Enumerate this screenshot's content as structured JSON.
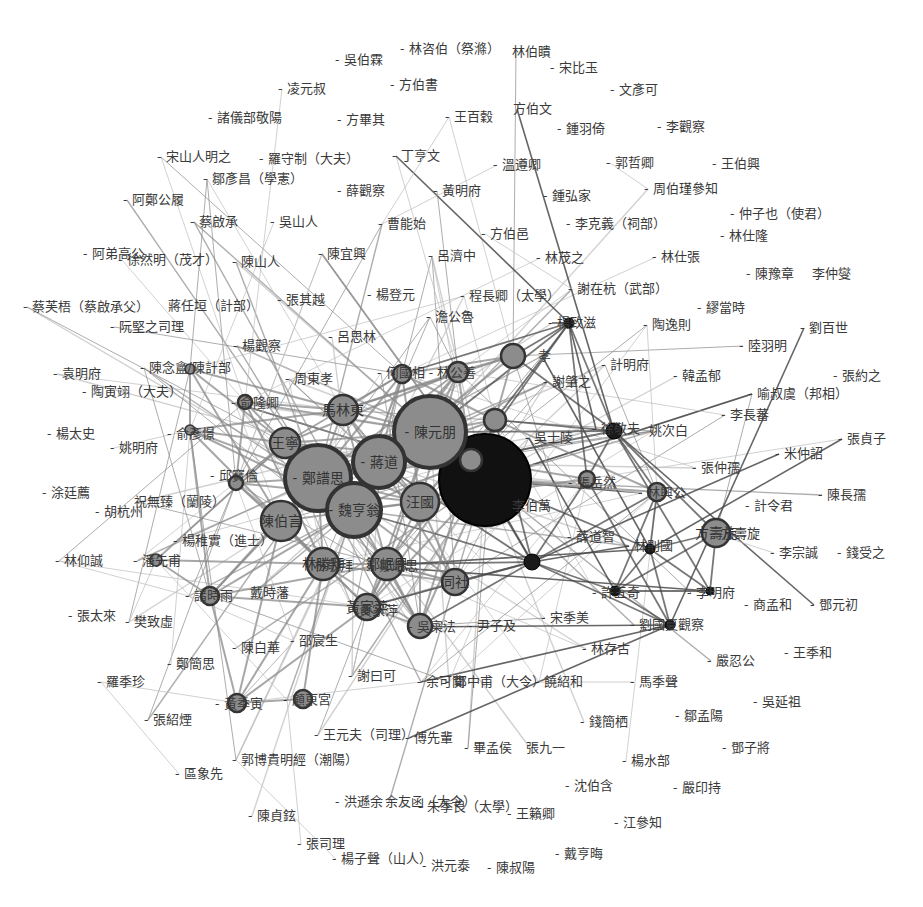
{
  "diagram": {
    "type": "network",
    "title": "",
    "colors": {
      "background": "#ffffff",
      "edge_light": "#bdbdbd",
      "edge_mid": "#8a8a8a",
      "edge_dark": "#4a4a4a",
      "node_fill": "#8c8c8c",
      "node_stroke": "#333333",
      "hub_fill": "#111111",
      "label": "#3a3a3a"
    },
    "nodes": [
      {
        "id": "hub",
        "label": "",
        "x": 485,
        "y": 480,
        "r": 46,
        "kind": "black"
      },
      {
        "id": "n_chen_yuanpeng",
        "label": "陳元朋",
        "x": 430,
        "y": 432,
        "r": 36,
        "kind": "big"
      },
      {
        "id": "n_zheng",
        "label": "鄭譜思",
        "x": 318,
        "y": 478,
        "r": 33,
        "kind": "big"
      },
      {
        "id": "n_jiang",
        "label": "蔣道",
        "x": 379,
        "y": 462,
        "r": 26,
        "kind": "big"
      },
      {
        "id": "n_wei",
        "label": "魏亨翁",
        "x": 354,
        "y": 510,
        "r": 27,
        "kind": "big"
      },
      {
        "id": "n_chen_bo",
        "label": "陳伯言",
        "x": 281,
        "y": 521,
        "r": 20,
        "kind": "mid"
      },
      {
        "id": "n_wang_xuan",
        "label": "汪國",
        "x": 420,
        "y": 502,
        "r": 19,
        "kind": "mid"
      },
      {
        "id": "n_ma",
        "label": "馬林東",
        "x": 343,
        "y": 410,
        "r": 15,
        "kind": "mid"
      },
      {
        "id": "n_wang_yu",
        "label": "王寧",
        "x": 285,
        "y": 443,
        "r": 15,
        "kind": "mid"
      },
      {
        "id": "n_lin_xi",
        "label": "林勝拜",
        "x": 323,
        "y": 564,
        "r": 16,
        "kind": "mid"
      },
      {
        "id": "n_deng",
        "label": "鄒岷思",
        "x": 387,
        "y": 564,
        "r": 16,
        "kind": "mid"
      },
      {
        "id": "n_tong",
        "label": "同社",
        "x": 455,
        "y": 582,
        "r": 13,
        "kind": "mid"
      },
      {
        "id": "n_wu_yu",
        "label": "吳奕玉",
        "x": 471,
        "y": 460,
        "r": 11,
        "kind": "mid"
      },
      {
        "id": "n_zhou_qi",
        "label": "周岐之",
        "x": 495,
        "y": 420,
        "r": 11,
        "kind": "mid"
      },
      {
        "id": "n_hu_xing",
        "label": "胡景孝",
        "x": 513,
        "y": 356,
        "r": 12,
        "kind": "mid"
      },
      {
        "id": "n_hu_xian",
        "label": "何國相",
        "x": 402,
        "y": 374,
        "r": 9,
        "kind": "mid"
      },
      {
        "id": "n_lin_gongshan",
        "label": "林公善",
        "x": 458,
        "y": 372,
        "r": 10,
        "kind": "mid"
      },
      {
        "id": "n_huang_jia",
        "label": "黃家萍",
        "x": 367,
        "y": 607,
        "r": 13,
        "kind": "mid"
      },
      {
        "id": "n_wu_jiwei",
        "label": "吳寀法",
        "x": 420,
        "y": 626,
        "r": 12,
        "kind": "mid"
      },
      {
        "id": "n_zhang_zhaoran",
        "label": "張岳然",
        "x": 587,
        "y": 479,
        "r": 8,
        "kind": "mid"
      },
      {
        "id": "n_lin_gong",
        "label": "林興公",
        "x": 657,
        "y": 492,
        "r": 9,
        "kind": "mid"
      },
      {
        "id": "n_fang_qi",
        "label": "方壽旋",
        "x": 716,
        "y": 533,
        "r": 14,
        "kind": "mid"
      },
      {
        "id": "n_qiu",
        "label": "邱寶",
        "x": 236,
        "y": 483,
        "r": 7,
        "kind": "mid"
      },
      {
        "id": "n_yu_long",
        "label": "俞隆卿",
        "x": 245,
        "y": 402,
        "r": 7,
        "kind": "mid"
      },
      {
        "id": "n_chen_nian",
        "label": "陳念盦",
        "x": 190,
        "y": 369,
        "r": 5,
        "kind": "small"
      },
      {
        "id": "n_yu_xin",
        "label": "俞彥憬",
        "x": 190,
        "y": 430,
        "r": 5,
        "kind": "small"
      },
      {
        "id": "n_zhu_shu",
        "label": "諸時雨",
        "x": 210,
        "y": 596,
        "r": 9,
        "kind": "mid"
      },
      {
        "id": "n_qian",
        "label": "潘先甫",
        "x": 156,
        "y": 560,
        "r": 6,
        "kind": "small"
      },
      {
        "id": "n_huang_ji",
        "label": "黃季寅",
        "x": 237,
        "y": 703,
        "r": 9,
        "kind": "mid"
      },
      {
        "id": "n_gu",
        "label": "顧東宮",
        "x": 303,
        "y": 699,
        "r": 9,
        "kind": "mid"
      },
      {
        "id": "n_yang_zhi",
        "label": "楊致滋",
        "x": 569,
        "y": 323,
        "r": 5,
        "kind": "dark"
      },
      {
        "id": "n_xu_dafu",
        "label": "徐敬夫",
        "x": 614,
        "y": 431,
        "r": 8,
        "kind": "dark"
      },
      {
        "id": "n_black2",
        "label": "林則國",
        "x": 532,
        "y": 562,
        "r": 8,
        "kind": "dark"
      },
      {
        "id": "n_lin_li",
        "label": "林禮國",
        "x": 650,
        "y": 549,
        "r": 5,
        "kind": "dark"
      },
      {
        "id": "n_xu_qi",
        "label": "許五奇",
        "x": 615,
        "y": 591,
        "r": 5,
        "kind": "dark"
      },
      {
        "id": "n_li_mingfu",
        "label": "李明府",
        "x": 710,
        "y": 591,
        "r": 4,
        "kind": "dark"
      },
      {
        "id": "n_liu_guan",
        "label": "劉國夏觀察",
        "x": 670,
        "y": 625,
        "r": 5,
        "kind": "dark"
      }
    ],
    "labels": [
      {
        "text": "- 吳伯霖",
        "x": 335,
        "y": 64
      },
      {
        "text": "- 林咨伯（祭滌）",
        "x": 400,
        "y": 53
      },
      {
        "text": "林伯瞶",
        "x": 512,
        "y": 56
      },
      {
        "text": "- 宋比玉",
        "x": 550,
        "y": 72
      },
      {
        "text": "- 凌元叔",
        "x": 278,
        "y": 93
      },
      {
        "text": "- 方伯書",
        "x": 390,
        "y": 89
      },
      {
        "text": "- 文彥可",
        "x": 610,
        "y": 94
      },
      {
        "text": "- 諸儀部敬陽",
        "x": 208,
        "y": 122
      },
      {
        "text": "- 方畢其",
        "x": 337,
        "y": 124
      },
      {
        "text": "- 王百穀",
        "x": 445,
        "y": 121
      },
      {
        "text": "方伯文",
        "x": 513,
        "y": 113
      },
      {
        "text": "- 鍾羽倚",
        "x": 557,
        "y": 133
      },
      {
        "text": "- 李觀察",
        "x": 657,
        "y": 131
      },
      {
        "text": "- 宋山人明之",
        "x": 157,
        "y": 161
      },
      {
        "text": "- 羅守制（大夫）",
        "x": 259,
        "y": 163
      },
      {
        "text": "- 丁亨文",
        "x": 392,
        "y": 160
      },
      {
        "text": "- 溫遵卿",
        "x": 493,
        "y": 169
      },
      {
        "text": "- 郭哲卿",
        "x": 606,
        "y": 167
      },
      {
        "text": "- 王伯興",
        "x": 712,
        "y": 168
      },
      {
        "text": "- 鄒彥昌（學憲）",
        "x": 203,
        "y": 183
      },
      {
        "text": "- 薛觀察",
        "x": 337,
        "y": 195
      },
      {
        "text": "- 黃明府",
        "x": 433,
        "y": 195
      },
      {
        "text": "- 鍾弘家",
        "x": 543,
        "y": 200
      },
      {
        "text": "- 周伯瑾參知",
        "x": 644,
        "y": 193
      },
      {
        "text": "- 阿鄭公履",
        "x": 123,
        "y": 204
      },
      {
        "text": "- 蔡啟承",
        "x": 190,
        "y": 226
      },
      {
        "text": "- 吳山人",
        "x": 270,
        "y": 226
      },
      {
        "text": "- 曹能始",
        "x": 378,
        "y": 228
      },
      {
        "text": "- 方伯邑",
        "x": 481,
        "y": 238
      },
      {
        "text": "- 李克義（祠部）",
        "x": 566,
        "y": 228
      },
      {
        "text": "- 仲子也（使君）",
        "x": 730,
        "y": 218
      },
      {
        "text": "- 林仕隆",
        "x": 720,
        "y": 240
      },
      {
        "text": "- 阿弟高公",
        "x": 83,
        "y": 258
      },
      {
        "text": "- 徐然明（茂才）",
        "x": 118,
        "y": 264
      },
      {
        "text": "- 陳山人",
        "x": 232,
        "y": 266
      },
      {
        "text": "- 陳宜興",
        "x": 318,
        "y": 258
      },
      {
        "text": "- 呂濟中",
        "x": 428,
        "y": 260
      },
      {
        "text": "- 林茂之",
        "x": 536,
        "y": 262
      },
      {
        "text": "- 林仕張",
        "x": 652,
        "y": 261
      },
      {
        "text": "- 陳豫章",
        "x": 746,
        "y": 278
      },
      {
        "text": "李仲燮",
        "x": 812,
        "y": 278
      },
      {
        "text": "- 蔡芙梧（蔡啟承父）",
        "x": 23,
        "y": 311
      },
      {
        "text": "蔣任垣（計部）",
        "x": 168,
        "y": 310
      },
      {
        "text": "- 張其越",
        "x": 277,
        "y": 304
      },
      {
        "text": "- 楊登元",
        "x": 367,
        "y": 299
      },
      {
        "text": "- 程長卿（太學）",
        "x": 460,
        "y": 300
      },
      {
        "text": "- 謝在杭（武部）",
        "x": 568,
        "y": 293
      },
      {
        "text": "- 繆當時",
        "x": 697,
        "y": 312
      },
      {
        "text": "- 阮堅之司理",
        "x": 110,
        "y": 331
      },
      {
        "text": "- 澹公魯",
        "x": 426,
        "y": 321
      },
      {
        "text": "- 楊致滋",
        "x": 548,
        "y": 327
      },
      {
        "text": "- 陶逸則",
        "x": 643,
        "y": 329
      },
      {
        "text": "- 劉百世",
        "x": 800,
        "y": 332
      },
      {
        "text": "- 楊觀察",
        "x": 233,
        "y": 350
      },
      {
        "text": "- 呂思林",
        "x": 328,
        "y": 341
      },
      {
        "text": "- 陸羽明",
        "x": 739,
        "y": 350
      },
      {
        "text": "- 袁明府",
        "x": 53,
        "y": 378
      },
      {
        "text": "- 陳念盦/陳計部",
        "x": 140,
        "y": 372
      },
      {
        "text": "- 周東孝",
        "x": 285,
        "y": 383
      },
      {
        "text": "- 何國相 - 林公善",
        "x": 377,
        "y": 377
      },
      {
        "text": "孝",
        "x": 538,
        "y": 360
      },
      {
        "text": "- 計明府",
        "x": 601,
        "y": 369
      },
      {
        "text": "- 韓孟郁",
        "x": 673,
        "y": 380
      },
      {
        "text": "- 張約之",
        "x": 833,
        "y": 380
      },
      {
        "text": "- 陶寅翊（大夫）",
        "x": 82,
        "y": 396
      },
      {
        "text": "- 謝肇之",
        "x": 543,
        "y": 386
      },
      {
        "text": "- 喻叔虞（邦相）",
        "x": 748,
        "y": 398
      },
      {
        "text": "- 俞隆卿",
        "x": 231,
        "y": 407
      },
      {
        "text": "- 李長蕃",
        "x": 721,
        "y": 419
      },
      {
        "text": "- 楊太史",
        "x": 47,
        "y": 438
      },
      {
        "text": "- 俞彥憬",
        "x": 167,
        "y": 438
      },
      {
        "text": "- 吳士陵",
        "x": 525,
        "y": 442
      },
      {
        "text": "- 徐敬夫",
        "x": 592,
        "y": 433
      },
      {
        "text": "姚次白",
        "x": 649,
        "y": 435
      },
      {
        "text": "- 張貞子",
        "x": 838,
        "y": 443
      },
      {
        "text": "- 姚明府",
        "x": 110,
        "y": 452
      },
      {
        "text": "- 米仲詔",
        "x": 775,
        "y": 458
      },
      {
        "text": "- 邱寶倫",
        "x": 210,
        "y": 480
      },
      {
        "text": "- 張仲孺",
        "x": 692,
        "y": 472
      },
      {
        "text": "- 涂廷薦",
        "x": 42,
        "y": 497
      },
      {
        "text": "祝無臻（蘭陵）",
        "x": 134,
        "y": 506
      },
      {
        "text": "- 張岳然",
        "x": 568,
        "y": 487
      },
      {
        "text": "- 林興公",
        "x": 638,
        "y": 497
      },
      {
        "text": "- 陳長孺",
        "x": 818,
        "y": 499
      },
      {
        "text": "- 胡杭州",
        "x": 95,
        "y": 516
      },
      {
        "text": "李伯萬",
        "x": 512,
        "y": 510
      },
      {
        "text": "- 計令君",
        "x": 745,
        "y": 510
      },
      {
        "text": "- 楊稚實（進士）",
        "x": 173,
        "y": 545
      },
      {
        "text": "- 薛道智",
        "x": 567,
        "y": 541
      },
      {
        "text": "- 林則國",
        "x": 625,
        "y": 550
      },
      {
        "text": "- 方壽旋",
        "x": 712,
        "y": 538
      },
      {
        "text": "- 林仰誠",
        "x": 55,
        "y": 565
      },
      {
        "text": "- 潘先甫",
        "x": 133,
        "y": 565
      },
      {
        "text": "- 林敬拜",
        "x": 305,
        "y": 570
      },
      {
        "text": "- 鄒岷思",
        "x": 370,
        "y": 570
      },
      {
        "text": "- 李宗誠",
        "x": 770,
        "y": 557
      },
      {
        "text": "- 錢受之",
        "x": 837,
        "y": 557
      },
      {
        "text": "- 諸時雨",
        "x": 185,
        "y": 600
      },
      {
        "text": "戴時藩",
        "x": 250,
        "y": 597
      },
      {
        "text": "- 許五奇",
        "x": 592,
        "y": 597
      },
      {
        "text": "- 李明府",
        "x": 687,
        "y": 597
      },
      {
        "text": "- 商孟和",
        "x": 744,
        "y": 609
      },
      {
        "text": "- 鄧元初",
        "x": 810,
        "y": 609
      },
      {
        "text": "- 張太來",
        "x": 68,
        "y": 620
      },
      {
        "text": "- 樊致虛",
        "x": 125,
        "y": 626
      },
      {
        "text": "- 黃家萍",
        "x": 350,
        "y": 615
      },
      {
        "text": "- 吳寀法",
        "x": 408,
        "y": 631
      },
      {
        "text": "- 尹子及",
        "x": 468,
        "y": 630
      },
      {
        "text": "- 宋季美",
        "x": 541,
        "y": 622
      },
      {
        "text": "- 劉國夏觀察",
        "x": 630,
        "y": 629
      },
      {
        "text": "- 王季和",
        "x": 784,
        "y": 657
      },
      {
        "text": "- 邵宸生",
        "x": 290,
        "y": 645
      },
      {
        "text": "- 林存古",
        "x": 582,
        "y": 653
      },
      {
        "text": "- 嚴忍公",
        "x": 707,
        "y": 665
      },
      {
        "text": "- 鄭簡思",
        "x": 167,
        "y": 668
      },
      {
        "text": "- 陳白華",
        "x": 232,
        "y": 652
      },
      {
        "text": "- 謝曰可",
        "x": 348,
        "y": 680
      },
      {
        "text": "- 余可聞",
        "x": 417,
        "y": 686
      },
      {
        "text": "- 鄭中甫（大令）",
        "x": 445,
        "y": 686
      },
      {
        "text": "- 饒紹和",
        "x": 535,
        "y": 686
      },
      {
        "text": "- 馬季聲",
        "x": 630,
        "y": 686
      },
      {
        "text": "- 羅季珍",
        "x": 97,
        "y": 686
      },
      {
        "text": "- 黃季寅",
        "x": 215,
        "y": 708
      },
      {
        "text": "- 顧東宮",
        "x": 283,
        "y": 704
      },
      {
        "text": "- 吳延祖",
        "x": 753,
        "y": 706
      },
      {
        "text": "- 張紹煙",
        "x": 144,
        "y": 724
      },
      {
        "text": "- 鄒孟陽",
        "x": 675,
        "y": 720
      },
      {
        "text": "- 錢簡栖",
        "x": 580,
        "y": 726
      },
      {
        "text": "- 王元夫（司理）",
        "x": 314,
        "y": 739
      },
      {
        "text": "- 傅先輩",
        "x": 405,
        "y": 742
      },
      {
        "text": "- 畢孟侯",
        "x": 464,
        "y": 752
      },
      {
        "text": "張九一",
        "x": 526,
        "y": 752
      },
      {
        "text": "- 鄧子將",
        "x": 722,
        "y": 752
      },
      {
        "text": "- 郭博貴明經（潮陽）",
        "x": 232,
        "y": 764
      },
      {
        "text": "- 楊水部",
        "x": 622,
        "y": 765
      },
      {
        "text": "- 區象先",
        "x": 175,
        "y": 778
      },
      {
        "text": "- 沈伯含",
        "x": 565,
        "y": 790
      },
      {
        "text": "- 嚴印持",
        "x": 673,
        "y": 792
      },
      {
        "text": "- 洪遜余",
        "x": 335,
        "y": 806
      },
      {
        "text": "余友函（大令）",
        "x": 385,
        "y": 806
      },
      {
        "text": "- 朱季良（太學）",
        "x": 418,
        "y": 811
      },
      {
        "text": "- 王籟卿",
        "x": 507,
        "y": 818
      },
      {
        "text": "- 陳貞鉉",
        "x": 248,
        "y": 820
      },
      {
        "text": "- 江參知",
        "x": 614,
        "y": 827
      },
      {
        "text": "- 張司理",
        "x": 297,
        "y": 848
      },
      {
        "text": "- 戴亨晦",
        "x": 555,
        "y": 858
      },
      {
        "text": "- 楊子聲（山人）",
        "x": 332,
        "y": 863
      },
      {
        "text": "- 洪元泰",
        "x": 422,
        "y": 870
      },
      {
        "text": "- 陳叔陽",
        "x": 487,
        "y": 872
      }
    ]
  }
}
